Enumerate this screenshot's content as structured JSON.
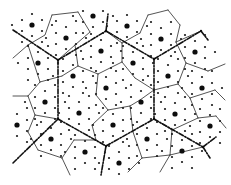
{
  "figure": {
    "width": 231,
    "height": 185,
    "colors": {
      "background": "#ffffff",
      "line": "#2a2a2a",
      "boundary": "#111111",
      "dot": "#111111"
    },
    "large_dots": [
      [
        32,
        25
      ],
      [
        93,
        16
      ],
      [
        66,
        38
      ],
      [
        101,
        51
      ],
      [
        38,
        63
      ],
      [
        73,
        76
      ],
      [
        106,
        88
      ],
      [
        127,
        26
      ],
      [
        161,
        39
      ],
      [
        195,
        52
      ],
      [
        133,
        63
      ],
      [
        168,
        76
      ],
      [
        202,
        88
      ],
      [
        45,
        102
      ],
      [
        79,
        113
      ],
      [
        17,
        125
      ],
      [
        113,
        125
      ],
      [
        51,
        139
      ],
      [
        85,
        152
      ],
      [
        141,
        102
      ],
      [
        175,
        114
      ],
      [
        210,
        126
      ],
      [
        147,
        139
      ],
      [
        182,
        151
      ],
      [
        119,
        163
      ]
    ],
    "junctions": [
      [
        58,
        60
      ],
      [
        106,
        31
      ],
      [
        154,
        59
      ],
      [
        201,
        31
      ],
      [
        58,
        119
      ],
      [
        106,
        146
      ],
      [
        154,
        119
      ],
      [
        203,
        147
      ]
    ],
    "boundaries": [
      [
        [
          13,
          30
        ],
        [
          58,
          60
        ]
      ],
      [
        [
          58,
          60
        ],
        [
          106,
          31
        ]
      ],
      [
        [
          106,
          31
        ],
        [
          154,
          59
        ]
      ],
      [
        [
          154,
          59
        ],
        [
          201,
          31
        ]
      ],
      [
        [
          58,
          60
        ],
        [
          58,
          119
        ]
      ],
      [
        [
          154,
          59
        ],
        [
          154,
          119
        ]
      ],
      [
        [
          13,
          163
        ],
        [
          58,
          119
        ]
      ],
      [
        [
          58,
          119
        ],
        [
          106,
          146
        ]
      ],
      [
        [
          106,
          146
        ],
        [
          154,
          119
        ]
      ],
      [
        [
          154,
          119
        ],
        [
          203,
          147
        ]
      ],
      [
        [
          106,
          31
        ],
        [
          108,
          14
        ]
      ],
      [
        [
          201,
          31
        ],
        [
          208,
          40
        ]
      ],
      [
        [
          203,
          147
        ],
        [
          216,
          137
        ]
      ],
      [
        [
          106,
          146
        ],
        [
          101,
          175
        ]
      ],
      [
        [
          203,
          147
        ],
        [
          210,
          158
        ]
      ]
    ],
    "cell_edges": [
      [
        [
          28,
          45
        ],
        [
          45,
          35
        ],
        [
          52,
          15
        ]
      ],
      [
        [
          52,
          15
        ],
        [
          78,
          12
        ]
      ],
      [
        [
          78,
          12
        ],
        [
          90,
          32
        ]
      ],
      [
        [
          90,
          32
        ],
        [
          75,
          45
        ]
      ],
      [
        [
          75,
          45
        ],
        [
          78,
          66
        ]
      ],
      [
        [
          78,
          66
        ],
        [
          98,
          74
        ]
      ],
      [
        [
          98,
          74
        ],
        [
          122,
          62
        ]
      ],
      [
        [
          122,
          62
        ],
        [
          122,
          43
        ]
      ],
      [
        [
          122,
          43
        ],
        [
          106,
          31
        ]
      ],
      [
        [
          122,
          43
        ],
        [
          140,
          33
        ]
      ],
      [
        [
          140,
          33
        ],
        [
          148,
          15
        ]
      ],
      [
        [
          148,
          15
        ],
        [
          168,
          10
        ]
      ],
      [
        [
          168,
          10
        ],
        [
          180,
          25
        ]
      ],
      [
        [
          180,
          25
        ],
        [
          176,
          42
        ]
      ],
      [
        [
          176,
          42
        ],
        [
          201,
          31
        ]
      ],
      [
        [
          176,
          42
        ],
        [
          186,
          63
        ]
      ],
      [
        [
          186,
          63
        ],
        [
          208,
          71
        ]
      ],
      [
        [
          208,
          71
        ],
        [
          225,
          64
        ]
      ],
      [
        [
          186,
          63
        ],
        [
          178,
          84
        ]
      ],
      [
        [
          178,
          84
        ],
        [
          190,
          98
        ]
      ],
      [
        [
          190,
          98
        ],
        [
          215,
          90
        ]
      ],
      [
        [
          178,
          84
        ],
        [
          154,
          90
        ]
      ],
      [
        [
          154,
          90
        ],
        [
          135,
          78
        ]
      ],
      [
        [
          135,
          78
        ],
        [
          122,
          62
        ]
      ],
      [
        [
          154,
          90
        ],
        [
          140,
          100
        ]
      ],
      [
        [
          98,
          74
        ],
        [
          96,
          95
        ]
      ],
      [
        [
          96,
          95
        ],
        [
          108,
          110
        ]
      ],
      [
        [
          108,
          110
        ],
        [
          130,
          106
        ]
      ],
      [
        [
          130,
          106
        ],
        [
          140,
          100
        ]
      ],
      [
        [
          130,
          106
        ],
        [
          133,
          132
        ]
      ],
      [
        [
          108,
          110
        ],
        [
          92,
          125
        ]
      ],
      [
        [
          92,
          125
        ],
        [
          96,
          140
        ]
      ],
      [
        [
          96,
          140
        ],
        [
          106,
          146
        ]
      ],
      [
        [
          78,
          66
        ],
        [
          62,
          76
        ]
      ],
      [
        [
          62,
          76
        ],
        [
          40,
          82
        ]
      ],
      [
        [
          40,
          82
        ],
        [
          28,
          96
        ]
      ],
      [
        [
          28,
          96
        ],
        [
          35,
          115
        ]
      ],
      [
        [
          35,
          115
        ],
        [
          58,
          119
        ]
      ],
      [
        [
          35,
          115
        ],
        [
          28,
          132
        ]
      ],
      [
        [
          28,
          132
        ],
        [
          38,
          150
        ]
      ],
      [
        [
          38,
          150
        ],
        [
          62,
          158
        ]
      ],
      [
        [
          62,
          158
        ],
        [
          70,
          175
        ]
      ],
      [
        [
          62,
          158
        ],
        [
          74,
          140
        ]
      ],
      [
        [
          74,
          140
        ],
        [
          96,
          140
        ]
      ],
      [
        [
          75,
          45
        ],
        [
          58,
          60
        ]
      ],
      [
        [
          28,
          45
        ],
        [
          40,
          82
        ]
      ],
      [
        [
          13,
          58
        ],
        [
          28,
          45
        ]
      ],
      [
        [
          13,
          96
        ],
        [
          28,
          96
        ]
      ],
      [
        [
          190,
          98
        ],
        [
          198,
          118
        ]
      ],
      [
        [
          198,
          118
        ],
        [
          216,
          116
        ]
      ],
      [
        [
          198,
          118
        ],
        [
          172,
          130
        ]
      ],
      [
        [
          172,
          130
        ],
        [
          154,
          119
        ]
      ],
      [
        [
          172,
          130
        ],
        [
          170,
          155
        ]
      ],
      [
        [
          170,
          155
        ],
        [
          160,
          172
        ]
      ],
      [
        [
          170,
          155
        ],
        [
          203,
          147
        ]
      ],
      [
        [
          133,
          132
        ],
        [
          142,
          158
        ]
      ],
      [
        [
          142,
          158
        ],
        [
          128,
          172
        ]
      ],
      [
        [
          142,
          158
        ],
        [
          170,
          155
        ]
      ],
      [
        [
          225,
          100
        ],
        [
          215,
          90
        ]
      ],
      [
        [
          216,
          116
        ],
        [
          226,
          128
        ]
      ]
    ]
  }
}
